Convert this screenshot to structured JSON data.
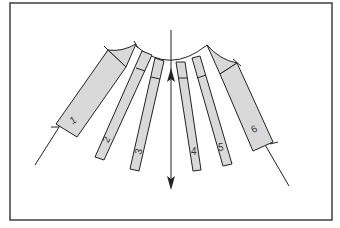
{
  "diagram": {
    "segments": [
      {
        "id": 1,
        "label": "1"
      },
      {
        "id": 2,
        "label": "2"
      },
      {
        "id": 3,
        "label": "3"
      },
      {
        "id": 4,
        "label": "4"
      },
      {
        "id": 5,
        "label": "5"
      },
      {
        "id": 6,
        "label": "6"
      }
    ],
    "arrow": {
      "direction": "vertical",
      "heads": [
        "up",
        "down"
      ]
    },
    "colors": {
      "frame": "#4a4a4a",
      "fill": "#d9d9d9",
      "stroke": "#222222",
      "background": "#ffffff"
    }
  }
}
